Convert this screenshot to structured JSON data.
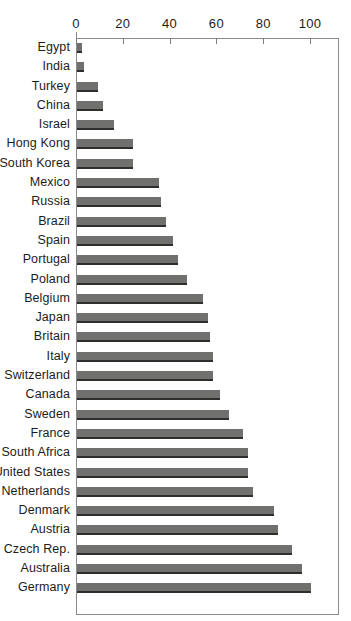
{
  "chart_data": {
    "type": "bar",
    "orientation": "horizontal",
    "title": "",
    "xlabel": "",
    "ylabel": "",
    "xlim": [
      0,
      100
    ],
    "ylim": null,
    "grid": false,
    "legend": null,
    "axis_position": "top",
    "tick_labels": [
      "0",
      "20",
      "40",
      "60",
      "80",
      "100"
    ],
    "ticks": [
      0,
      20,
      40,
      60,
      80,
      100
    ],
    "bar_color": "#70706f",
    "bar_edge_color": "#2e2e2d",
    "categories": [
      "Egypt",
      "India",
      "Turkey",
      "China",
      "Israel",
      "Hong Kong",
      "South Korea",
      "Mexico",
      "Russia",
      "Brazil",
      "Spain",
      "Portugal",
      "Poland",
      "Belgium",
      "Japan",
      "Britain",
      "Italy",
      "Switzerland",
      "Canada",
      "Sweden",
      "France",
      "South Africa",
      "United States",
      "Netherlands",
      "Denmark",
      "Austria",
      "Czech Rep.",
      "Australia",
      "Germany"
    ],
    "values": [
      2,
      3,
      9,
      11,
      16,
      24,
      24,
      35,
      36,
      38,
      41,
      43,
      47,
      54,
      56,
      57,
      58,
      58,
      61,
      65,
      71,
      73,
      73,
      75,
      84,
      86,
      92,
      96,
      100
    ]
  }
}
